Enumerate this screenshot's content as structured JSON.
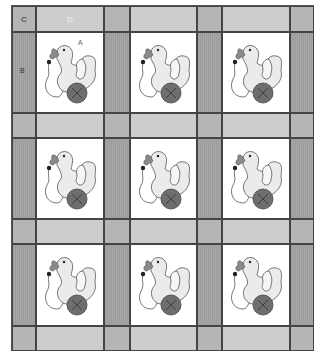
{
  "diagram": {
    "type": "quilt-layout",
    "grid": {
      "block_rows": 3,
      "block_cols": 3
    },
    "labels": {
      "A": "A",
      "B": "B",
      "C": "C",
      "D": "D"
    },
    "colors": {
      "corner": "#b5b5b5",
      "horizontal_sashing": "#cdcdcd",
      "vertical_sashing": "#a0a0a0",
      "block_background": "#ffffff",
      "duck_body": "#e8e8e8",
      "beak": "#8a8a8a",
      "wheel": "#6e6e6e"
    },
    "blocks": [
      {
        "row": 1,
        "col": 1,
        "motif": "duck-on-wheel",
        "label": "A"
      },
      {
        "row": 1,
        "col": 2,
        "motif": "duck-on-wheel"
      },
      {
        "row": 1,
        "col": 3,
        "motif": "duck-on-wheel"
      },
      {
        "row": 2,
        "col": 1,
        "motif": "duck-on-wheel"
      },
      {
        "row": 2,
        "col": 2,
        "motif": "duck-on-wheel"
      },
      {
        "row": 2,
        "col": 3,
        "motif": "duck-on-wheel"
      },
      {
        "row": 3,
        "col": 1,
        "motif": "duck-on-wheel"
      },
      {
        "row": 3,
        "col": 2,
        "motif": "duck-on-wheel"
      },
      {
        "row": 3,
        "col": 3,
        "motif": "duck-on-wheel"
      }
    ]
  }
}
